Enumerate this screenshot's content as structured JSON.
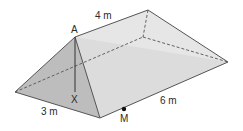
{
  "diagram": {
    "type": "triangular-prism",
    "labels": {
      "apex": "A",
      "foot": "X",
      "midpoint": "M",
      "top_edge": "4 m",
      "base_width": "3 m",
      "length": "6 m"
    },
    "colors": {
      "front_face": "#bdbdbd",
      "side_face": "#dcdcdc",
      "back_face": "#e6e6e6",
      "edge": "#555555",
      "text": "#2b2b2b"
    }
  }
}
